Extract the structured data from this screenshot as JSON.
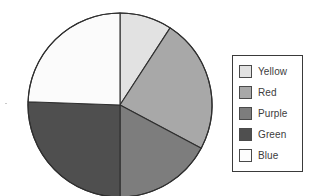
{
  "chart_data": {
    "type": "pie",
    "title": "",
    "categories": [
      "Yellow",
      "Red",
      "Purple",
      "Green",
      "Blue"
    ],
    "values": [
      9.2,
      23.6,
      17.2,
      25.6,
      24.4
    ],
    "units": "percent",
    "start_angle_deg": 0,
    "direction": "clockwise",
    "slice_boundaries_deg": [
      0,
      33,
      118,
      180,
      272,
      360
    ],
    "slice_colors": [
      "#e2e2e2",
      "#a8a8a8",
      "#7d7d7d",
      "#4f4f4f",
      "#fbfbfb"
    ],
    "legend_position": "right",
    "grid": false,
    "xlabel": "",
    "ylabel": ""
  },
  "pie": {
    "center_x": 120,
    "center_y": 105,
    "radius": 92,
    "outline_color": "#2f2f2f",
    "slices": [
      {
        "label": "Yellow",
        "value": 9.2,
        "start_deg": 0,
        "end_deg": 33,
        "color": "#e2e2e2"
      },
      {
        "label": "Red",
        "value": 23.6,
        "start_deg": 33,
        "end_deg": 118,
        "color": "#a8a8a8"
      },
      {
        "label": "Purple",
        "value": 17.2,
        "start_deg": 118,
        "end_deg": 180,
        "color": "#7d7d7d"
      },
      {
        "label": "Green",
        "value": 25.6,
        "start_deg": 180,
        "end_deg": 272,
        "color": "#4f4f4f"
      },
      {
        "label": "Blue",
        "value": 24.4,
        "start_deg": 272,
        "end_deg": 360,
        "color": "#fbfbfb"
      }
    ]
  },
  "legend": {
    "border_color": "#3a3a3a",
    "items": [
      {
        "label": "Yellow",
        "color": "#e2e2e2"
      },
      {
        "label": "Red",
        "color": "#a8a8a8"
      },
      {
        "label": "Purple",
        "color": "#7d7d7d"
      },
      {
        "label": "Green",
        "color": "#4f4f4f"
      },
      {
        "label": "Blue",
        "color": "#fdfdfd"
      }
    ]
  }
}
